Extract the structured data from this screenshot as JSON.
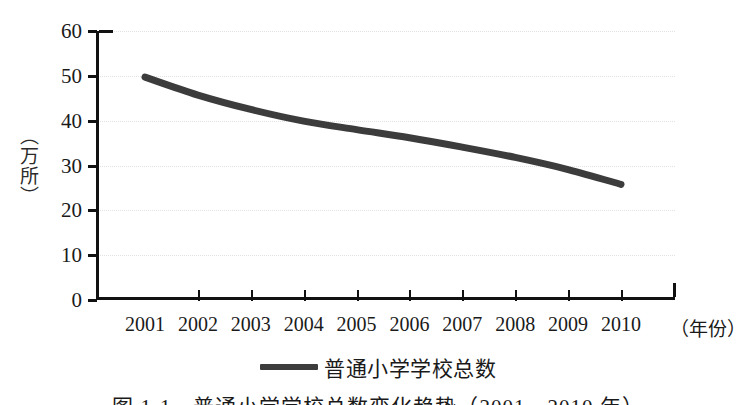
{
  "chart_data": {
    "type": "line",
    "title": "",
    "xlabel": "（年份）",
    "ylabel": "（万所）",
    "categories": [
      "2001",
      "2002",
      "2003",
      "2004",
      "2005",
      "2006",
      "2007",
      "2008",
      "2009",
      "2010"
    ],
    "series": [
      {
        "name": "普通小学学校总数",
        "values": [
          49.7,
          45.7,
          42.5,
          39.9,
          38.0,
          36.2,
          34.1,
          31.8,
          29.1,
          25.8
        ],
        "color": "#3c3c3c"
      }
    ],
    "ylim": [
      0,
      60
    ],
    "yticks": [
      0,
      10,
      20,
      30,
      40,
      50,
      60
    ],
    "ytick_labels": [
      "0",
      "10",
      "20",
      "30",
      "40",
      "50",
      "60"
    ],
    "grid": "horizontal-dotted",
    "legend_position": "bottom-center"
  },
  "legend": {
    "swatch_name": "line-swatch",
    "label": "普通小学学校总数"
  },
  "axes": {
    "y_title": "（万所）",
    "x_unit": "（年份）"
  },
  "caption": {
    "text": "图 1-1　普通小学学校总数变化趋势（2001—2010 年）"
  },
  "colors": {
    "series_line": "#3c3c3c",
    "axis": "#111111",
    "gridline": "#e2e2e2",
    "background": "#ffffff"
  }
}
